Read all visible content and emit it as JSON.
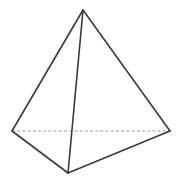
{
  "figure": {
    "shape_name": "tetrahedron",
    "background_color": "#ffffff",
    "solid_edge_color": "#3a3a3c",
    "hidden_edge_color": "#9a9a9a",
    "solid_edge_width": 1.6,
    "hidden_edge_width": 1.1,
    "hidden_edge_dash": "3 2.2",
    "canvas": {
      "width": 181,
      "height": 184
    },
    "vertices": [
      {
        "id": "apex",
        "label": "apex",
        "x": 83,
        "y": 10
      },
      {
        "id": "base-left",
        "label": "base left",
        "x": 12,
        "y": 131
      },
      {
        "id": "base-right",
        "label": "base right",
        "x": 170,
        "y": 131
      },
      {
        "id": "base-front",
        "label": "base front",
        "x": 68,
        "y": 173
      }
    ],
    "edges": [
      {
        "id": "apex-to-base-left",
        "from": "apex",
        "to": "base-left",
        "style": "solid"
      },
      {
        "id": "apex-to-base-right",
        "from": "apex",
        "to": "base-right",
        "style": "solid"
      },
      {
        "id": "apex-to-base-front",
        "from": "apex",
        "to": "base-front",
        "style": "solid"
      },
      {
        "id": "base-left-to-base-front",
        "from": "base-left",
        "to": "base-front",
        "style": "solid"
      },
      {
        "id": "base-right-to-base-front",
        "from": "base-right",
        "to": "base-front",
        "style": "solid"
      },
      {
        "id": "base-left-to-base-right",
        "from": "base-left",
        "to": "base-right",
        "style": "dashed"
      }
    ]
  }
}
